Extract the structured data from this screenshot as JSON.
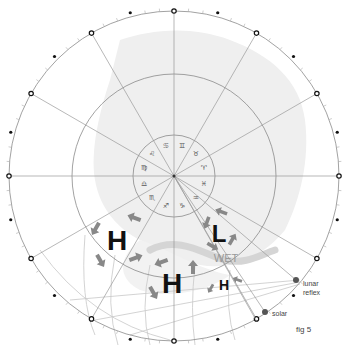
{
  "figure": {
    "label": "fig 5",
    "colors": {
      "ring": "#8a8a8a",
      "land": "#ececec",
      "arrow": "#888888",
      "band": "#d5d5d5",
      "point": "#555555"
    }
  },
  "zodiac": [
    {
      "name": "aries",
      "glyph": "♈"
    },
    {
      "name": "taurus",
      "glyph": "♉"
    },
    {
      "name": "gemini",
      "glyph": "♊"
    },
    {
      "name": "cancer",
      "glyph": "♋"
    },
    {
      "name": "leo",
      "glyph": "♌"
    },
    {
      "name": "virgo",
      "glyph": "♍"
    },
    {
      "name": "libra",
      "glyph": "♎"
    },
    {
      "name": "scorpio",
      "glyph": "♏"
    },
    {
      "name": "sagittarius",
      "glyph": "♐"
    },
    {
      "name": "capricorn",
      "glyph": "♑"
    },
    {
      "name": "aquarius",
      "glyph": "♒"
    },
    {
      "name": "pisces",
      "glyph": "♓"
    }
  ],
  "pressure_systems": [
    {
      "type": "high",
      "label": "H"
    },
    {
      "type": "low",
      "label": "L"
    },
    {
      "type": "high",
      "label": "H"
    },
    {
      "type": "high",
      "label": "H"
    }
  ],
  "annotations": {
    "wet": "WET",
    "lunar_reflex": [
      "lunar",
      "reflex"
    ],
    "solar": "solar"
  }
}
